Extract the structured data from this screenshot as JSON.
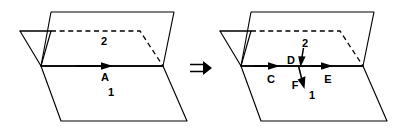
{
  "figure": {
    "background_color": "#ffffff",
    "ink_color": "#000000",
    "panels": [
      {
        "id": "left",
        "name": "before",
        "plane_labels": [
          {
            "id": "plane-2",
            "text": "2",
            "x": 104,
            "y": 40
          },
          {
            "id": "plane-1",
            "text": "1",
            "x": 111,
            "y": 92
          }
        ],
        "vectors": [
          {
            "id": "A",
            "text": "A",
            "label_x": 105,
            "label_y": 80,
            "direction": "right",
            "along": "intersection-line"
          }
        ]
      },
      {
        "id": "right",
        "name": "after",
        "plane_labels": [
          {
            "id": "plane-2",
            "text": "2",
            "x": 305,
            "y": 42
          },
          {
            "id": "plane-1",
            "text": "1",
            "x": 311,
            "y": 96
          }
        ],
        "vectors": [
          {
            "id": "C",
            "text": "C",
            "label_x": 271,
            "label_y": 82,
            "direction": "right",
            "along": "intersection-line"
          },
          {
            "id": "D",
            "text": "D",
            "label_x": 291,
            "label_y": 63,
            "direction": "down",
            "along": "vertical-plane-2"
          },
          {
            "id": "E",
            "text": "E",
            "label_x": 327,
            "label_y": 82,
            "direction": "right",
            "along": "intersection-line"
          },
          {
            "id": "F",
            "text": "F",
            "label_x": 297,
            "label_y": 88,
            "direction": "down-right",
            "along": "plane-1"
          }
        ]
      }
    ],
    "operator": {
      "id": "implies",
      "glyph": "=>",
      "name": "double-right-arrow",
      "x": 198,
      "y": 68
    }
  }
}
